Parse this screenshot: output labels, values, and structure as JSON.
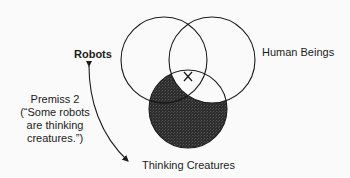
{
  "diagram": {
    "type": "venn",
    "circles": [
      {
        "id": "robots",
        "label": "Robots",
        "cx": 164,
        "cy": 60,
        "r": 43
      },
      {
        "id": "human_beings",
        "label": "Human Beings",
        "cx": 212,
        "cy": 60,
        "r": 43
      },
      {
        "id": "thinking_creatures",
        "label": "Thinking Creatures",
        "cx": 188,
        "cy": 109,
        "r": 39
      }
    ],
    "shaded_region": "Thinking Creatures outside Human Beings",
    "shade_color": "#333333",
    "x_mark": {
      "label": "X",
      "region": "Robots ∩ Human Beings ∩ Thinking Creatures"
    },
    "annotation": {
      "lines": [
        "Premiss 2",
        "(“Some robots",
        "are thinking",
        "creatures.”)"
      ],
      "arrow": "curved double-headed arrow from Robots to Thinking Creatures"
    }
  },
  "labels": {
    "robots": "Robots",
    "human": "Human Beings",
    "thinking": "Thinking Creatures"
  }
}
